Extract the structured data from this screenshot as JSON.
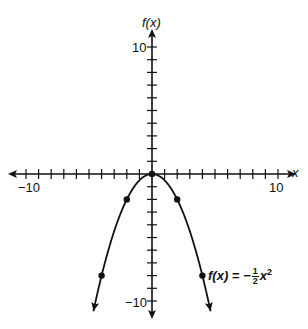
{
  "chart_data": {
    "type": "line",
    "title": "",
    "xlabel": "x",
    "ylabel": "f(x)",
    "xlim": [
      -10,
      10
    ],
    "ylim": [
      -10,
      10
    ],
    "x_tick_labels": [
      "-10",
      "10"
    ],
    "y_tick_labels": [
      "10",
      "-10"
    ],
    "tick_step": 1,
    "grid": false,
    "series": [
      {
        "name": "f(x) = -1/2 x^2",
        "function": "-0.5*x^2",
        "points": [
          {
            "x": -4,
            "y": -8
          },
          {
            "x": -2,
            "y": -2
          },
          {
            "x": 0,
            "y": 0
          },
          {
            "x": 2,
            "y": -2
          },
          {
            "x": 4,
            "y": -8
          }
        ],
        "arrows_both_ends": true
      }
    ],
    "annotation": {
      "lhs": "f(x) = −",
      "frac_num": "1",
      "frac_den": "2",
      "var": "x",
      "exp": "2"
    }
  },
  "labels": {
    "y_axis": "f(x)",
    "x_axis": "x",
    "x_min": "−10",
    "x_max": "10",
    "y_max": "10",
    "y_min": "−10"
  }
}
